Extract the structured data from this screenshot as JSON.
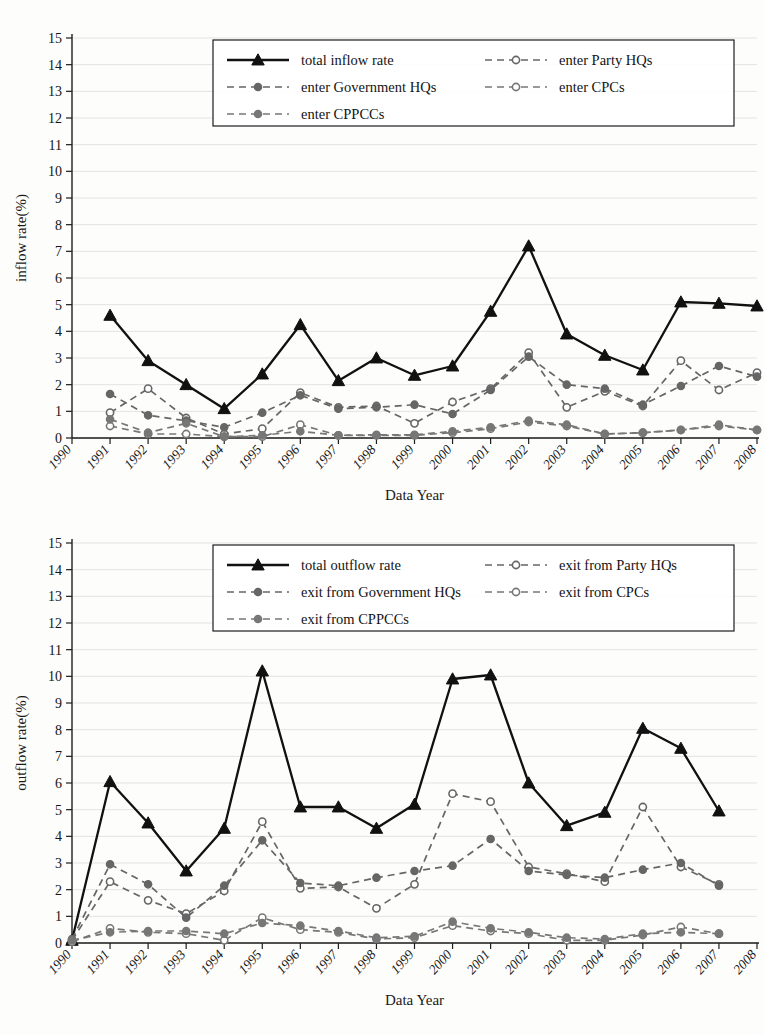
{
  "figure": {
    "background_color": "#fdfdfb",
    "grid_color": "#dcdce0",
    "axis_color": "#1d1d1d",
    "total_line_color": "#111111",
    "sub_line_color": "#666666"
  },
  "chart_data": [
    {
      "id": "inflow",
      "type": "line",
      "title": "",
      "xlabel": "Data Year",
      "ylabel": "inflow rate(%)",
      "xlim": [
        1990,
        2008
      ],
      "ylim": [
        0,
        15
      ],
      "ytick_labels": [
        "0",
        "1",
        "2",
        "3",
        "4",
        "5",
        "6",
        "7",
        "8",
        "9",
        "10",
        "11",
        "12",
        "13",
        "14",
        "15"
      ],
      "xtick_labels": [
        "1990",
        "1991",
        "1992",
        "1993",
        "1994",
        "1995",
        "1996",
        "1997",
        "1998",
        "1999",
        "2000",
        "2001",
        "2002",
        "2003",
        "2004",
        "2005",
        "2006",
        "2007",
        "2008"
      ],
      "grid": true,
      "legend_position": "top-center",
      "x": [
        1991,
        1992,
        1993,
        1994,
        1995,
        1996,
        1997,
        1998,
        1999,
        2000,
        2001,
        2002,
        2003,
        2004,
        2005,
        2006,
        2007,
        2008
      ],
      "series": [
        {
          "name": "total inflow rate",
          "style": "solid",
          "marker": "triangle",
          "color": "#111111",
          "values": [
            4.6,
            2.9,
            2.0,
            1.1,
            2.4,
            4.25,
            2.15,
            3.0,
            2.35,
            2.7,
            4.75,
            7.2,
            3.9,
            3.1,
            2.55,
            5.1,
            5.05,
            4.95
          ]
        },
        {
          "name": "enter Party HQs",
          "style": "dashed",
          "marker": "circle-open",
          "color": "#666666",
          "values": [
            0.95,
            1.85,
            0.75,
            0.15,
            0.35,
            1.7,
            1.15,
            1.2,
            0.55,
            1.35,
            1.85,
            3.2,
            1.15,
            1.75,
            1.2,
            2.9,
            1.8,
            2.45
          ]
        },
        {
          "name": "enter Government HQs",
          "style": "dashed",
          "marker": "circle-filled",
          "color": "#666666",
          "values": [
            1.65,
            0.85,
            0.65,
            0.4,
            0.95,
            1.6,
            1.1,
            1.15,
            1.25,
            0.9,
            1.8,
            3.05,
            2.0,
            1.85,
            1.25,
            1.95,
            2.7,
            2.3
          ]
        },
        {
          "name": "enter CPCs",
          "style": "dashed",
          "marker": "circle-open",
          "color": "#777777",
          "values": [
            0.45,
            0.15,
            0.15,
            0.05,
            0.05,
            0.5,
            0.1,
            0.1,
            0.1,
            0.2,
            0.35,
            0.6,
            0.45,
            0.15,
            0.2,
            0.3,
            0.45,
            0.3
          ]
        },
        {
          "name": "enter CPPCCs",
          "style": "dashed",
          "marker": "circle-filled",
          "color": "#777777",
          "values": [
            0.7,
            0.2,
            0.55,
            0.05,
            0.1,
            0.25,
            0.1,
            0.12,
            0.12,
            0.25,
            0.4,
            0.65,
            0.5,
            0.15,
            0.2,
            0.3,
            0.5,
            0.3
          ]
        }
      ],
      "legend": [
        {
          "label": "total inflow rate",
          "style": "solid",
          "marker": "triangle"
        },
        {
          "label": "enter Party HQs",
          "style": "dashed",
          "marker": "circle-open"
        },
        {
          "label": "enter Government HQs",
          "style": "dashed",
          "marker": "circle-filled"
        },
        {
          "label": "enter CPCs",
          "style": "dashed",
          "marker": "circle-open"
        },
        {
          "label": "enter CPPCCs",
          "style": "dashed",
          "marker": "circle-filled"
        }
      ]
    },
    {
      "id": "outflow",
      "type": "line",
      "title": "",
      "xlabel": "Data Year",
      "ylabel": "outflow rate(%)",
      "xlim": [
        1990,
        2008
      ],
      "ylim": [
        0,
        15
      ],
      "ytick_labels": [
        "0",
        "1",
        "2",
        "3",
        "4",
        "5",
        "6",
        "7",
        "8",
        "9",
        "10",
        "11",
        "12",
        "13",
        "14",
        "15"
      ],
      "xtick_labels": [
        "1990",
        "1991",
        "1992",
        "1993",
        "1994",
        "1995",
        "1996",
        "1997",
        "1998",
        "1999",
        "2000",
        "2001",
        "2002",
        "2003",
        "2004",
        "2005",
        "2006",
        "2007",
        "2008"
      ],
      "grid": true,
      "legend_position": "top-center",
      "x": [
        1990,
        1991,
        1992,
        1993,
        1994,
        1995,
        1996,
        1997,
        1998,
        1999,
        2000,
        2001,
        2002,
        2003,
        2004,
        2005,
        2006,
        2007
      ],
      "series": [
        {
          "name": "total outflow rate",
          "style": "solid",
          "marker": "triangle",
          "color": "#111111",
          "values": [
            0.1,
            6.05,
            4.5,
            2.7,
            4.3,
            10.2,
            5.1,
            5.1,
            4.3,
            5.2,
            9.9,
            10.05,
            6.0,
            4.4,
            4.9,
            8.05,
            7.3,
            4.95
          ]
        },
        {
          "name": "exit from Party HQs",
          "style": "dashed",
          "marker": "circle-open",
          "color": "#666666",
          "values": [
            0.1,
            2.3,
            1.6,
            1.1,
            1.95,
            4.55,
            2.05,
            2.1,
            1.3,
            2.2,
            5.6,
            5.3,
            2.85,
            2.6,
            2.3,
            5.1,
            2.85,
            2.2
          ]
        },
        {
          "name": "exit from Government HQs",
          "style": "dashed",
          "marker": "circle-filled",
          "color": "#666666",
          "values": [
            0.15,
            2.95,
            2.2,
            0.95,
            2.15,
            3.85,
            2.25,
            2.15,
            2.45,
            2.7,
            2.9,
            3.9,
            2.7,
            2.55,
            2.45,
            2.75,
            3.0,
            2.15
          ]
        },
        {
          "name": "exit from CPCs",
          "style": "dashed",
          "marker": "circle-open",
          "color": "#777777",
          "values": [
            0.05,
            0.55,
            0.4,
            0.35,
            0.1,
            0.95,
            0.5,
            0.4,
            0.15,
            0.2,
            0.65,
            0.45,
            0.35,
            0.1,
            0.1,
            0.3,
            0.6,
            0.35
          ]
        },
        {
          "name": "exit from CPPCCs",
          "style": "dashed",
          "marker": "circle-filled",
          "color": "#777777",
          "values": [
            0.1,
            0.4,
            0.45,
            0.45,
            0.35,
            0.75,
            0.65,
            0.45,
            0.2,
            0.25,
            0.8,
            0.55,
            0.4,
            0.2,
            0.15,
            0.35,
            0.4,
            0.35
          ]
        }
      ],
      "legend": [
        {
          "label": "total outflow rate",
          "style": "solid",
          "marker": "triangle"
        },
        {
          "label": "exit from Party HQs",
          "style": "dashed",
          "marker": "circle-open"
        },
        {
          "label": "exit from Government HQs",
          "style": "dashed",
          "marker": "circle-filled"
        },
        {
          "label": "exit from CPCs",
          "style": "dashed",
          "marker": "circle-open"
        },
        {
          "label": "exit from CPPCCs",
          "style": "dashed",
          "marker": "circle-filled"
        }
      ]
    }
  ]
}
